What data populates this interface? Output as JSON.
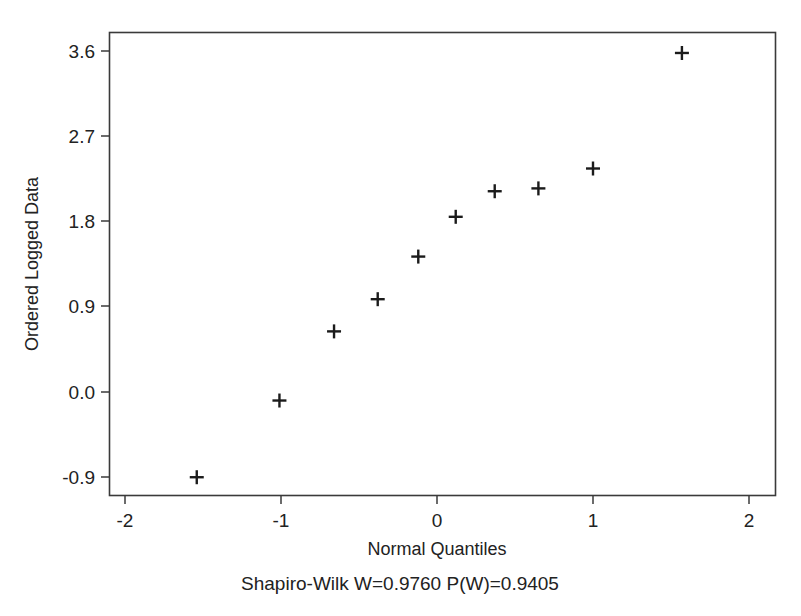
{
  "chart_data": {
    "type": "scatter",
    "title": "",
    "xlabel": "Normal Quantiles",
    "ylabel": "Ordered Logged Data",
    "xlim": [
      -2.35,
      2.25
    ],
    "ylim": [
      -1.12,
      3.82
    ],
    "xticks": [
      -2,
      -1,
      0,
      1,
      2
    ],
    "xtick_labels": [
      "-2",
      "-1",
      "0",
      "1",
      "2"
    ],
    "yticks": [
      3.6,
      2.7,
      1.8,
      0.9,
      0.0,
      -0.9
    ],
    "ytick_labels": [
      "3.6",
      "2.7",
      "1.8",
      "0.9",
      "0.0",
      "-0.9"
    ],
    "grid": false,
    "legend": "none",
    "marker": "plus",
    "marker_color": "#1b1b1b",
    "series": [
      {
        "name": "Ordered Logged Data",
        "points": [
          {
            "x": -1.54,
            "y": -0.9
          },
          {
            "x": -1.01,
            "y": -0.09
          },
          {
            "x": -0.66,
            "y": 0.64
          },
          {
            "x": -0.38,
            "y": 0.98
          },
          {
            "x": -0.12,
            "y": 1.43
          },
          {
            "x": 0.12,
            "y": 1.85
          },
          {
            "x": 0.37,
            "y": 2.12
          },
          {
            "x": 0.65,
            "y": 2.15
          },
          {
            "x": 1.0,
            "y": 2.36
          },
          {
            "x": 1.57,
            "y": 3.58
          }
        ]
      }
    ],
    "annotations": [
      {
        "id": "shapiro-wilk",
        "text": "Shapiro-Wilk W=0.9760 P(W)=0.9405"
      }
    ]
  },
  "caption": {
    "shapiro_wilk": "Shapiro-Wilk W=0.9760 P(W)=0.9405"
  },
  "axes": {
    "x_title": "Normal Quantiles",
    "y_title": "Ordered Logged Data"
  }
}
